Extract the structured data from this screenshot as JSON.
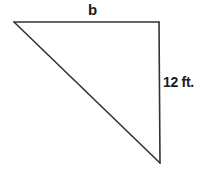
{
  "diagram": {
    "type": "right-triangle",
    "stroke_color": "#333333",
    "vertices": {
      "top_left": [
        14,
        22
      ],
      "top_right": [
        159,
        22
      ],
      "bottom_right": [
        160,
        163
      ]
    },
    "labels": {
      "top_side": "b",
      "right_side": "12 ft."
    }
  }
}
